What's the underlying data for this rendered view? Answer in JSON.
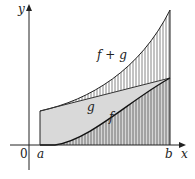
{
  "figure": {
    "title": "",
    "axes": {
      "x_label": "x",
      "y_label": "y",
      "origin_label": "0",
      "a_label": "a",
      "b_label": "b"
    },
    "curves": {
      "f_label": "f",
      "g_label": "g",
      "f_plus_g_label": "f + g"
    },
    "colors": {
      "ink": "#222222",
      "fill_gray": "#d9d9d9",
      "hatch": "#555555",
      "background": "#ffffff"
    }
  }
}
